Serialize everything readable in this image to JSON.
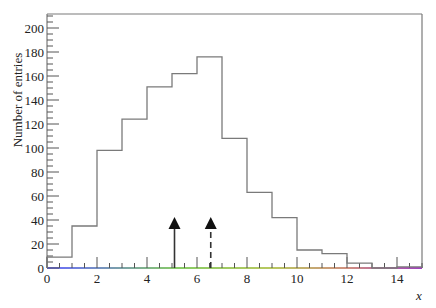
{
  "chart_data": {
    "type": "bar",
    "style": "step-histogram",
    "title": "",
    "xlabel": "x",
    "ylabel": "Number of entries",
    "xlim": [
      0,
      15
    ],
    "ylim": [
      0,
      210
    ],
    "x_ticks": [
      0,
      2,
      4,
      6,
      8,
      10,
      12,
      14
    ],
    "y_ticks": [
      0,
      20,
      40,
      60,
      80,
      100,
      120,
      140,
      160,
      180,
      200
    ],
    "bin_edges": [
      0,
      1,
      2,
      3,
      4,
      5,
      6,
      7,
      8,
      9,
      10,
      11,
      12,
      13,
      14,
      15
    ],
    "categories": [
      "0-1",
      "1-2",
      "2-3",
      "3-4",
      "4-5",
      "5-6",
      "6-7",
      "7-8",
      "8-9",
      "9-10",
      "10-11",
      "11-12",
      "12-13",
      "13-14",
      "14-15"
    ],
    "values": [
      9,
      35,
      98,
      124,
      151,
      162,
      176,
      108,
      63,
      42,
      15,
      12,
      4,
      0,
      1
    ],
    "annotations": [
      {
        "type": "arrow",
        "style": "solid",
        "x": 5.1,
        "y_from": 0,
        "y_to": 40
      },
      {
        "type": "arrow",
        "style": "dashed",
        "x": 6.55,
        "y_from": 0,
        "y_to": 40
      }
    ],
    "x_axis_line": "rainbow gradient (blue → green → yellow → red → purple)",
    "grid": false,
    "legend": null
  },
  "colors": {
    "histogram": "#7a7a7a",
    "frame": "#7a7a7a",
    "arrow": "#111111",
    "axis_gradient": [
      "#6a6aff",
      "#88cc66",
      "#c8c860",
      "#d08080",
      "#a040c0"
    ]
  }
}
